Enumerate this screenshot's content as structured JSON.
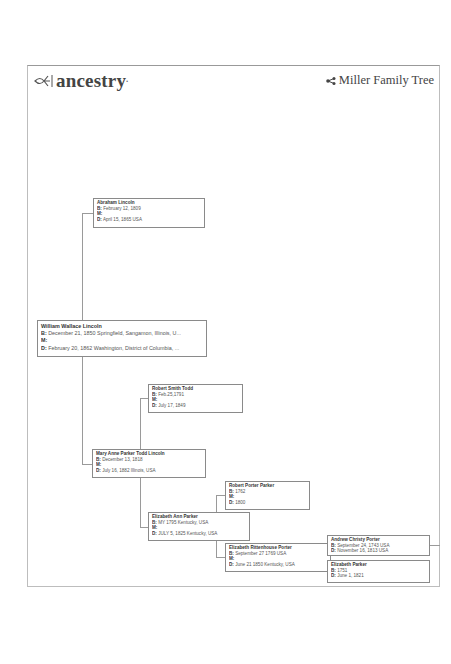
{
  "header": {
    "brand": "ancestry",
    "tree_title": "Miller Family Tree",
    "tree_icon": "tree-share-icon"
  },
  "labels": {
    "birth": "B:",
    "marriage": "M:",
    "death": "D:"
  },
  "people": [
    {
      "id": "abraham",
      "name": "Abraham Lincoln",
      "birth": "February 12, 1809",
      "marriage": "",
      "death": "April 15, 1865 USA"
    },
    {
      "id": "william",
      "name": "William Wallace Lincoln",
      "birth": "December 21, 1850 Springfield, Sangamon, Illinois, U...",
      "marriage": "",
      "death": "February 20, 1862 Washington, District of Columbia, ..."
    },
    {
      "id": "robert_todd",
      "name": "Robert Smith Todd",
      "birth": "Feb.25,1791",
      "marriage": "",
      "death": "July 17, 1849"
    },
    {
      "id": "mary",
      "name": "Mary Anne Parker Todd Lincoln",
      "birth": "December 13, 1818",
      "marriage": "",
      "death": "July 16, 1882 Illinois, USA"
    },
    {
      "id": "robert_parker",
      "name": "Robert Porter Parker",
      "birth": "1762",
      "marriage": "",
      "death": "1800"
    },
    {
      "id": "elizabeth_ann",
      "name": "Elizabeth Ann Parker",
      "birth": "MY 1795 Kentucky, USA",
      "marriage": "",
      "death": "JULY 5, 1825 Kentucky, USA"
    },
    {
      "id": "elizabeth_ritt",
      "name": "Elizabeth Rittenhouse Porter",
      "birth": "September 27 1769 USA",
      "marriage": "",
      "death": "June 21 1850 Kentucky, USA"
    },
    {
      "id": "andrew",
      "name": "Andrew Christy Porter",
      "birth": "September 24, 1743 USA",
      "death": "November 16, 1813 USA"
    },
    {
      "id": "elizabeth_parker",
      "name": "Elizabeth Parker",
      "birth": "1751",
      "death": "June 1, 1821"
    }
  ]
}
